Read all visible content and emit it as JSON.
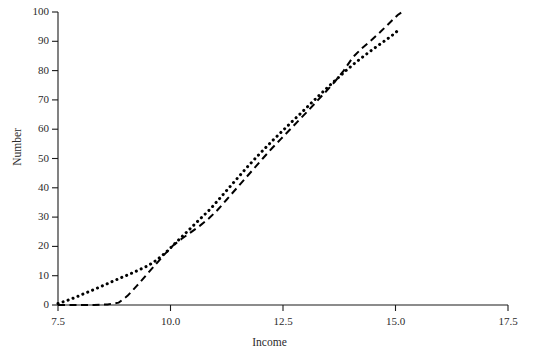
{
  "chart_data": {
    "type": "line",
    "title": "",
    "xlabel": "Income",
    "ylabel": "Number",
    "xlim": [
      7.5,
      17.5
    ],
    "ylim": [
      0,
      100
    ],
    "xticks": [
      "7.5",
      "10.0",
      "12.5",
      "15.0",
      "17.5"
    ],
    "xtick_values": [
      7.5,
      10.0,
      12.5,
      15.0,
      17.5
    ],
    "yticks": [
      "0",
      "10",
      "20",
      "30",
      "40",
      "50",
      "60",
      "70",
      "80",
      "90",
      "100"
    ],
    "ytick_values": [
      0,
      10,
      20,
      30,
      40,
      50,
      60,
      70,
      80,
      90,
      100
    ],
    "grid": false,
    "legend": "none",
    "series": [
      {
        "name": "dotted-curve",
        "style": "dotted",
        "color": "#000000",
        "x": [
          7.5,
          7.7,
          7.9,
          8.1,
          8.3,
          8.5,
          8.7,
          8.9,
          9.1,
          9.3,
          9.5,
          9.7,
          9.9,
          10.1,
          10.3,
          10.5,
          10.7,
          10.9,
          11.1,
          11.3,
          11.5,
          11.7,
          11.9,
          12.1,
          12.3,
          12.5,
          12.7,
          12.9,
          13.1,
          13.3,
          13.5,
          13.7,
          13.9,
          14.1,
          14.3,
          14.5,
          14.7,
          14.9,
          15.05
        ],
        "y": [
          0.5,
          1.5,
          2.7,
          4.0,
          5.3,
          6.6,
          8.0,
          9.3,
          10.6,
          12.0,
          13.4,
          15.4,
          18.0,
          21.0,
          24.0,
          27.0,
          30.0,
          33.0,
          36.5,
          40.0,
          43.5,
          47.0,
          50.3,
          53.5,
          56.6,
          59.6,
          62.6,
          65.5,
          68.5,
          71.5,
          74.4,
          77.2,
          80.0,
          82.6,
          85.0,
          87.3,
          89.5,
          91.7,
          93.6
        ]
      },
      {
        "name": "dashed-curve",
        "style": "dashed",
        "color": "#000000",
        "x": [
          7.5,
          7.9,
          8.3,
          8.6,
          8.85,
          9.05,
          9.25,
          9.45,
          9.65,
          9.85,
          10.05,
          10.25,
          10.45,
          10.65,
          10.85,
          11.05,
          11.25,
          11.45,
          11.65,
          11.85,
          12.05,
          12.25,
          12.45,
          12.65,
          12.85,
          13.05,
          13.25,
          13.45,
          13.65,
          13.85,
          14.05,
          14.25,
          14.45,
          14.65,
          14.85,
          15.05,
          15.15
        ],
        "y": [
          0.0,
          0.0,
          0.0,
          0.2,
          0.8,
          3.2,
          6.5,
          10.0,
          13.5,
          17.0,
          20.2,
          22.6,
          24.8,
          27.0,
          29.5,
          32.5,
          36.0,
          39.5,
          43.0,
          46.5,
          50.0,
          53.4,
          56.6,
          59.8,
          63.0,
          66.2,
          69.5,
          72.8,
          76.2,
          80.0,
          84.5,
          87.6,
          90.2,
          93.0,
          96.0,
          99.0,
          100.0
        ]
      }
    ]
  },
  "axes": {
    "spine_color": "#1a1a1a"
  }
}
